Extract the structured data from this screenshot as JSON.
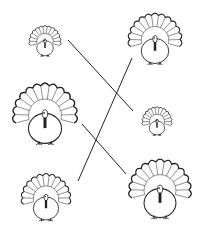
{
  "worksheet": {
    "type": "matching-exercise",
    "subject": "turkeys by size",
    "left_column": [
      {
        "id": "L1",
        "label": "small turkey",
        "cx": 45,
        "cy": 44,
        "r": 15
      },
      {
        "id": "L2",
        "label": "large turkey",
        "cx": 45,
        "cy": 120,
        "r": 30
      },
      {
        "id": "L3",
        "label": "medium turkey",
        "cx": 46,
        "cy": 202,
        "r": 23
      }
    ],
    "right_column": [
      {
        "id": "R1",
        "label": "medium turkey",
        "cx": 155,
        "cy": 44,
        "r": 25
      },
      {
        "id": "R2",
        "label": "small turkey",
        "cx": 157,
        "cy": 124,
        "r": 14
      },
      {
        "id": "R3",
        "label": "large turkey",
        "cx": 160,
        "cy": 195,
        "r": 29
      }
    ],
    "connections": [
      {
        "from": "L1",
        "to": "R2",
        "x1": 68,
        "y1": 40,
        "x2": 133,
        "y2": 111
      },
      {
        "from": "L3",
        "to": "R1",
        "x1": 78,
        "y1": 181,
        "x2": 132,
        "y2": 58
      },
      {
        "from": "L2",
        "to": "R3",
        "x1": 82,
        "y1": 124,
        "x2": 126,
        "y2": 174
      }
    ],
    "colors": {
      "ink": "#222222",
      "paper": "#ffffff"
    }
  }
}
